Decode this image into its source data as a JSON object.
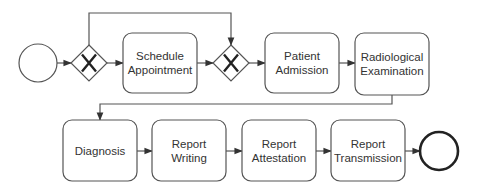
{
  "diagram": {
    "type": "bpmn-process",
    "colors": {
      "stroke": "#555555",
      "text": "#333333",
      "background": "#ffffff"
    },
    "start_event": {
      "cx": 38,
      "cy": 63,
      "r": 19
    },
    "end_event": {
      "cx": 439,
      "cy": 151,
      "r": 19
    },
    "gateways": [
      {
        "id": "gw1",
        "type": "exclusive",
        "cx": 89,
        "cy": 63,
        "half": 18
      },
      {
        "id": "gw2",
        "type": "exclusive",
        "cx": 231,
        "cy": 63,
        "half": 18
      }
    ],
    "tasks": [
      {
        "id": "t1",
        "x": 123,
        "y": 33,
        "w": 74,
        "h": 60,
        "lines": [
          "Schedule",
          "Appointment"
        ]
      },
      {
        "id": "t2",
        "x": 265,
        "y": 33,
        "w": 74,
        "h": 60,
        "lines": [
          "Patient",
          "Admission"
        ]
      },
      {
        "id": "t3",
        "x": 355,
        "y": 33,
        "w": 74,
        "h": 62,
        "lines": [
          "Radiological",
          "Examination"
        ]
      },
      {
        "id": "t4",
        "x": 63,
        "y": 120,
        "w": 74,
        "h": 61,
        "lines": [
          "Diagnosis"
        ]
      },
      {
        "id": "t5",
        "x": 152,
        "y": 120,
        "w": 74,
        "h": 61,
        "lines": [
          "Report",
          "Writing"
        ]
      },
      {
        "id": "t6",
        "x": 242,
        "y": 120,
        "w": 74,
        "h": 61,
        "lines": [
          "Report",
          "Attestation"
        ]
      },
      {
        "id": "t7",
        "x": 331,
        "y": 120,
        "w": 74,
        "h": 61,
        "lines": [
          "Report",
          "Transmission"
        ]
      }
    ],
    "flows": [
      {
        "from": "start",
        "to": "gw1",
        "points": [
          [
            57,
            63
          ],
          [
            71,
            63
          ]
        ]
      },
      {
        "from": "gw1",
        "to": "t1",
        "points": [
          [
            107,
            63
          ],
          [
            123,
            63
          ]
        ]
      },
      {
        "from": "gw1",
        "to": "gw2",
        "points": [
          [
            89,
            45
          ],
          [
            89,
            13
          ],
          [
            231,
            13
          ],
          [
            231,
            45
          ]
        ]
      },
      {
        "from": "t1",
        "to": "gw2",
        "points": [
          [
            197,
            63
          ],
          [
            213,
            63
          ]
        ]
      },
      {
        "from": "gw2",
        "to": "t2",
        "points": [
          [
            249,
            63
          ],
          [
            265,
            63
          ]
        ]
      },
      {
        "from": "t2",
        "to": "t3",
        "points": [
          [
            339,
            63
          ],
          [
            355,
            63
          ]
        ]
      },
      {
        "from": "t3",
        "to": "t4",
        "points": [
          [
            392,
            95
          ],
          [
            392,
            104
          ],
          [
            100,
            104
          ],
          [
            100,
            120
          ]
        ]
      },
      {
        "from": "t4",
        "to": "t5",
        "points": [
          [
            137,
            151
          ],
          [
            152,
            151
          ]
        ]
      },
      {
        "from": "t5",
        "to": "t6",
        "points": [
          [
            226,
            151
          ],
          [
            242,
            151
          ]
        ]
      },
      {
        "from": "t6",
        "to": "t7",
        "points": [
          [
            316,
            151
          ],
          [
            331,
            151
          ]
        ]
      },
      {
        "from": "t7",
        "to": "end",
        "points": [
          [
            405,
            151
          ],
          [
            420,
            151
          ]
        ]
      }
    ]
  }
}
